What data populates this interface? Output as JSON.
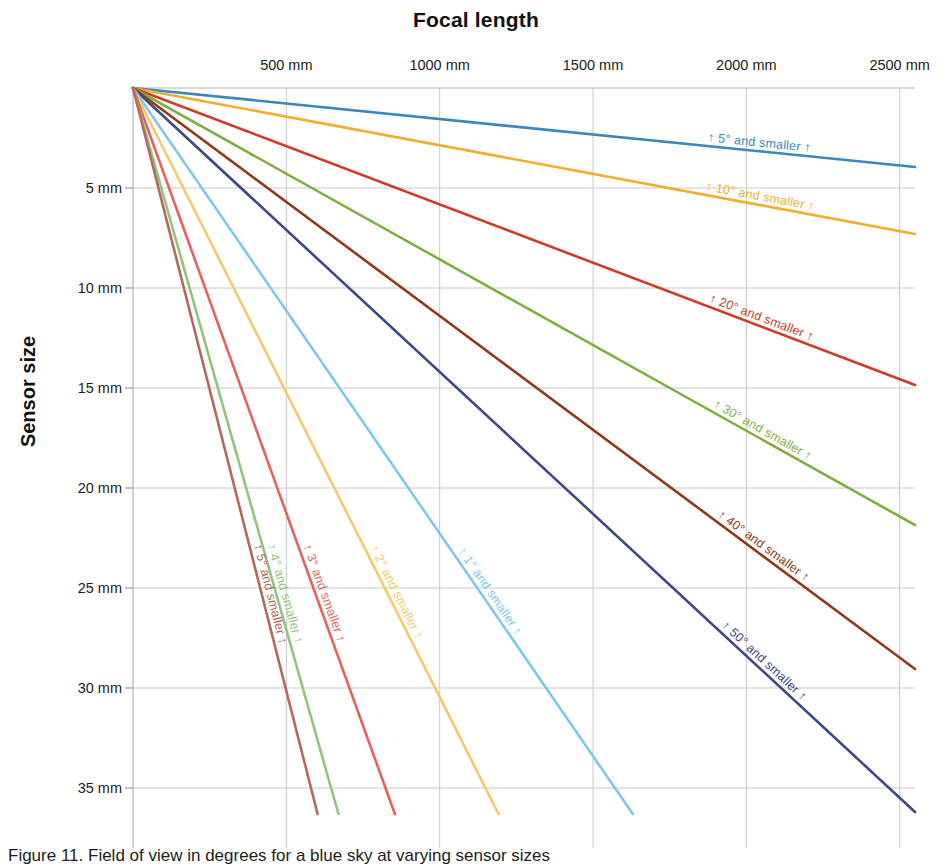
{
  "figure": {
    "caption": "Figure 11.  Field of view in degrees for a blue sky at varying sensor sizes"
  },
  "chart_data": {
    "type": "line",
    "title": "Focal length",
    "xlabel": "Focal length",
    "ylabel": "Sensor size",
    "xlim": [
      0,
      2550
    ],
    "ylim": [
      0,
      38
    ],
    "grid": true,
    "legend_position": "inline-along-lines",
    "x_tick_labels": [
      "500 mm",
      "1000 mm",
      "1500 mm",
      "2000 mm",
      "2500 mm"
    ],
    "x_ticks": [
      500,
      1000,
      1500,
      2000,
      2500
    ],
    "y_tick_labels": [
      "5 mm",
      "10 mm",
      "15 mm",
      "20 mm",
      "25 mm",
      "30 mm",
      "35 mm"
    ],
    "y_ticks": [
      5,
      10,
      15,
      20,
      25,
      30,
      35
    ],
    "origin": {
      "x": 0,
      "y": 0
    },
    "series": [
      {
        "name": "5-deg",
        "label": "↑ 5° and smaller ↑",
        "color": "#3b87bd",
        "x": [
          0,
          2550
        ],
        "y": [
          0,
          3.95
        ]
      },
      {
        "name": "10-deg",
        "label": "↑ 10° and smaller ↑",
        "color": "#f0ae2e",
        "x": [
          0,
          2550
        ],
        "y": [
          0,
          7.3
        ]
      },
      {
        "name": "20-deg",
        "label": "↑ 20° and smaller ↑",
        "color": "#d03a28",
        "x": [
          0,
          2550
        ],
        "y": [
          0,
          14.85
        ]
      },
      {
        "name": "30-deg",
        "label": "↑ 30° and smaller ↑",
        "color": "#7fb03f",
        "x": [
          0,
          2550
        ],
        "y": [
          0,
          21.85
        ]
      },
      {
        "name": "40-deg",
        "label": "↑ 40° and smaller ↑",
        "color": "#8e3b1a",
        "x": [
          0,
          2550
        ],
        "y": [
          0,
          29.05
        ]
      },
      {
        "name": "50-deg",
        "label": "↑ 50° and smaller ↑",
        "color": "#3c4a82",
        "x": [
          0,
          2550
        ],
        "y": [
          0,
          36.2
        ]
      },
      {
        "name": "1-deg",
        "label": "↑ 1° and smaller ↑",
        "color": "#7ec8e8",
        "x": [
          0,
          1630
        ],
        "y": [
          0,
          36.3
        ]
      },
      {
        "name": "2-deg",
        "label": "↑ 2° and smaller ↑",
        "color": "#f5c96a",
        "x": [
          0,
          1192
        ],
        "y": [
          0,
          36.3
        ]
      },
      {
        "name": "3-deg",
        "label": "↑ 3° and smaller ↑",
        "color": "#e8605a",
        "x": [
          0,
          854
        ],
        "y": [
          0,
          36.3
        ]
      },
      {
        "name": "4-deg",
        "label": "↑ 4° and smaller ↑",
        "color": "#93c47d",
        "x": [
          0,
          670
        ],
        "y": [
          0,
          36.3
        ]
      },
      {
        "name": "5-deg-steep",
        "label": "↑ 5° and smaller ↑",
        "color": "#b5685e",
        "x": [
          0,
          602
        ],
        "y": [
          0,
          36.3
        ]
      }
    ]
  },
  "axis": {
    "x_title": "Focal length",
    "y_title": "Sensor size"
  }
}
